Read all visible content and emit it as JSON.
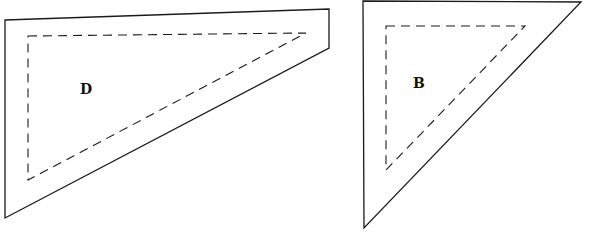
{
  "colors": {
    "background": "#ffffff",
    "stroke": "#1a1a1a",
    "label": "#111111"
  },
  "shapes": [
    {
      "id": "D",
      "label": "D",
      "outer_points": "5,20 329,9 329,48 5,218",
      "inner_points": "28,36 306,33 28,180",
      "label_pos": [
        86,
        94
      ]
    },
    {
      "id": "B",
      "label": "B",
      "outer_points": "363,1 581,2 364,228",
      "inner_points": "386,26 525,26 386,170",
      "label_pos": [
        419,
        88
      ]
    }
  ]
}
